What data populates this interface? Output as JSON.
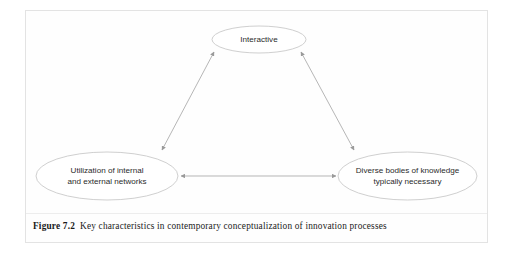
{
  "figure": {
    "caption_label": "Figure 7.2",
    "caption_text": "Key characteristics in contemporary conceptualization of innovation processes"
  },
  "diagram": {
    "type": "triangular-relationship-diagram",
    "nodes": [
      {
        "id": "interactive",
        "lines": [
          "Interactive"
        ],
        "position": "top"
      },
      {
        "id": "utilization-of-networks",
        "lines": [
          "Utilization of internal",
          "and external networks"
        ],
        "position": "bottom-left"
      },
      {
        "id": "diverse-bodies-of-knowledge",
        "lines": [
          "Diverse bodies of knowledge",
          "typically necessary"
        ],
        "position": "bottom-right"
      }
    ],
    "connectors": [
      {
        "id": "top-to-left",
        "from": "interactive",
        "to": "utilization-of-networks",
        "style": "double-headed-arrow"
      },
      {
        "id": "top-to-right",
        "from": "interactive",
        "to": "diverse-bodies-of-knowledge",
        "style": "double-headed-arrow"
      },
      {
        "id": "left-to-right",
        "from": "utilization-of-networks",
        "to": "diverse-bodies-of-knowledge",
        "style": "double-headed-arrow"
      }
    ]
  },
  "colors": {
    "page_background": "#ffffff",
    "frame_border": "#e3e3e3",
    "ellipse_stroke": "#c9c9c9",
    "connector_stroke": "#a9a9a9",
    "node_text": "#2b2b2b",
    "caption_text": "#1a1a1a"
  }
}
